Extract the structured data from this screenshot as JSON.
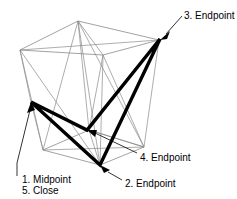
{
  "figure": {
    "name": "3d-wireframe-polyline-diagram",
    "background_color": "#ffffff",
    "wire_color": "#8a8a8a",
    "bold_color": "#000000",
    "text_color": "#000000",
    "width": 237,
    "height": 199
  },
  "labels": [
    {
      "id": "label-3",
      "text": "3. Endpoint",
      "x": 184,
      "y": 10
    },
    {
      "id": "label-4",
      "text": "4. Endpoint",
      "x": 140,
      "y": 152
    },
    {
      "id": "label-1",
      "text": "1. Midpoint",
      "x": 22,
      "y": 174
    },
    {
      "id": "label-5",
      "text": "5. Close",
      "x": 22,
      "y": 185
    },
    {
      "id": "label-2",
      "text": "2. Endpoint",
      "x": 125,
      "y": 178
    }
  ],
  "points": {
    "p1_midpoint": {
      "label": "1. Midpoint / 5. Close",
      "x": 31,
      "y": 102
    },
    "p2_endpoint": {
      "label": "2. Endpoint",
      "x": 100,
      "y": 165
    },
    "p3_endpoint": {
      "label": "3. Endpoint",
      "x": 160,
      "y": 39
    },
    "p4_endpoint": {
      "label": "4. Endpoint",
      "x": 87,
      "y": 130
    }
  },
  "geometry": {
    "description": "Truncated pyramid wireframe box seen in perspective with a bold closed polyline drawn across its faces",
    "top_face": [
      [
        78,
        21
      ],
      [
        20,
        50
      ],
      [
        103,
        55
      ],
      [
        159,
        40
      ]
    ],
    "bottom_face": [
      [
        43,
        150
      ],
      [
        100,
        165
      ],
      [
        144,
        147
      ],
      [
        89,
        130
      ]
    ],
    "bold_polyline": [
      [
        31,
        102
      ],
      [
        100,
        165
      ],
      [
        160,
        39
      ],
      [
        87,
        130
      ],
      [
        31,
        102
      ]
    ]
  },
  "leaders": [
    {
      "id": "leader-3",
      "from": [
        182,
        16
      ],
      "to": [
        161,
        40
      ]
    },
    {
      "id": "leader-4",
      "from": [
        137,
        153
      ],
      "to": [
        90,
        131
      ]
    },
    {
      "id": "leader-1",
      "from": [
        19,
        176
      ],
      "to": [
        32,
        104
      ]
    },
    {
      "id": "leader-2",
      "from": [
        122,
        180
      ],
      "to": [
        103,
        167
      ]
    }
  ]
}
